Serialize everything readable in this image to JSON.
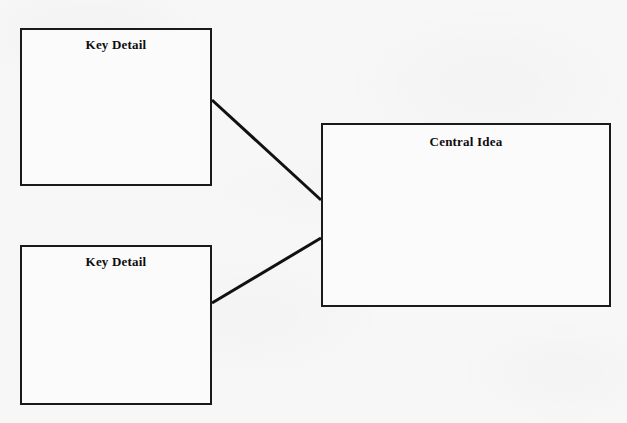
{
  "document": {
    "type": "graphic-organizer",
    "background_color": "#f7f7f7",
    "ink_color": "#1a1a1a"
  },
  "diagram": {
    "nodes": [
      {
        "id": "key-detail-1",
        "label": "Key Detail",
        "role": "supporting-detail",
        "x": 20,
        "y": 28,
        "width": 192,
        "height": 158
      },
      {
        "id": "key-detail-2",
        "label": "Key Detail",
        "role": "supporting-detail",
        "x": 20,
        "y": 245,
        "width": 192,
        "height": 160
      },
      {
        "id": "central-idea",
        "label": "Central Idea",
        "role": "main-idea",
        "x": 321,
        "y": 123,
        "width": 290,
        "height": 184
      }
    ],
    "connectors": [
      {
        "id": "connector-1",
        "from": "key-detail-1",
        "to": "central-idea",
        "x1": 212,
        "y1": 100,
        "x2": 321,
        "y2": 200,
        "stroke_width": 3,
        "color": "#111111"
      },
      {
        "id": "connector-2",
        "from": "key-detail-2",
        "to": "central-idea",
        "x1": 212,
        "y1": 303,
        "x2": 321,
        "y2": 238,
        "stroke_width": 3,
        "color": "#111111"
      }
    ]
  }
}
